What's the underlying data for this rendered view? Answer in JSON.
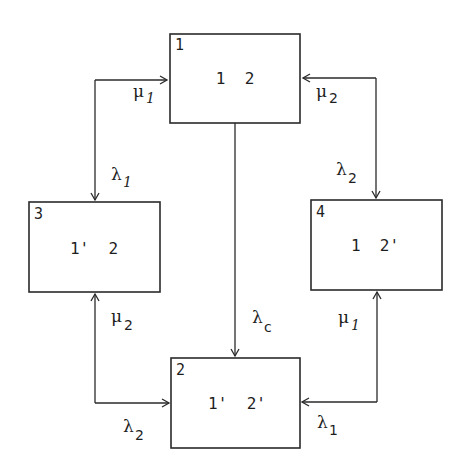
{
  "diagram": {
    "type": "state-transition",
    "states": [
      {
        "id": "1",
        "label": "1 2",
        "x": 170,
        "y": 34,
        "w": 130,
        "h": 89
      },
      {
        "id": "2",
        "label": "1' 2'",
        "x": 171,
        "y": 358,
        "w": 129,
        "h": 90
      },
      {
        "id": "3",
        "label": "1' 2",
        "x": 29,
        "y": 202,
        "w": 131,
        "h": 90
      },
      {
        "id": "4",
        "label": "1 2'",
        "x": 311,
        "y": 200,
        "w": 131,
        "h": 90
      }
    ],
    "transitions": [
      {
        "from": "3",
        "to": "1",
        "rate": "μ",
        "sub": "1",
        "sub_style": "italic"
      },
      {
        "from": "1",
        "to": "3",
        "rate": "λ",
        "sub": "1",
        "sub_style": "italic"
      },
      {
        "from": "4",
        "to": "1",
        "rate": "μ",
        "sub": "2",
        "sub_style": "upright"
      },
      {
        "from": "1",
        "to": "4",
        "rate": "λ",
        "sub": "2",
        "sub_style": "upright"
      },
      {
        "from": "1",
        "to": "2",
        "rate": "λ",
        "sub": "c",
        "sub_style": "upright"
      },
      {
        "from": "2",
        "to": "3",
        "rate": "μ",
        "sub": "2",
        "sub_style": "upright"
      },
      {
        "from": "3",
        "to": "2",
        "rate": "λ",
        "sub": "2",
        "sub_style": "upright"
      },
      {
        "from": "2",
        "to": "4",
        "rate": "μ",
        "sub": "1",
        "sub_style": "italic"
      },
      {
        "from": "4",
        "to": "2",
        "rate": "λ",
        "sub": "1",
        "sub_style": "upright"
      }
    ],
    "labels": {
      "mu1_top": {
        "sym": "μ",
        "sub": "1"
      },
      "lambda1_left": {
        "sym": "λ",
        "sub": "1"
      },
      "mu2_top": {
        "sym": "μ",
        "sub": "2"
      },
      "lambda2_right": {
        "sym": "λ",
        "sub": "2"
      },
      "lambda_c": {
        "sym": "λ",
        "sub": "c"
      },
      "mu2_bottom": {
        "sym": "μ",
        "sub": "2"
      },
      "lambda2_bottom": {
        "sym": "λ",
        "sub": "2"
      },
      "mu1_bottom": {
        "sym": "μ",
        "sub": "1"
      },
      "lambda1_bottom": {
        "sym": "λ",
        "sub": "1"
      }
    },
    "colors": {
      "stroke": "#2a2a2a",
      "text": "#1e1e1e",
      "background": "#ffffff"
    }
  }
}
